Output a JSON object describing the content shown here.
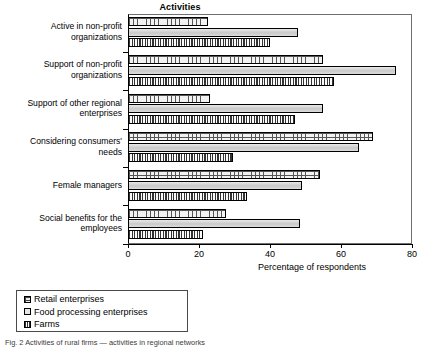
{
  "chart_data": {
    "type": "bar",
    "orientation": "horizontal",
    "title": "Activities",
    "xlabel": "Percentage of respondents",
    "ylabel": "",
    "xlim": [
      0,
      80
    ],
    "xticks": [
      0,
      20,
      40,
      60,
      80
    ],
    "grid": false,
    "legend_position": "below-left",
    "categories": [
      "Active in non-profit organizations",
      "Support of non-profit organizations",
      "Support of other regional enterprises",
      "Considering consumers' needs",
      "Female managers",
      "Social benefits for the employees"
    ],
    "category_lines": [
      [
        "Active in non-profit",
        "organizations"
      ],
      [
        "Support of non-profit",
        "organizations"
      ],
      [
        "Support of other regional",
        "enterprises"
      ],
      [
        "Considering consumers'",
        "needs"
      ],
      [
        "Female managers"
      ],
      [
        "Social benefits for the",
        "employees"
      ]
    ],
    "series": [
      {
        "name": "Retail enterprises",
        "values": [
          22.5,
          55,
          23,
          69,
          54,
          27.5
        ]
      },
      {
        "name": "Food processing enterprises",
        "values": [
          48,
          75.5,
          55,
          65,
          49,
          48.5
        ]
      },
      {
        "name": "Farms",
        "values": [
          40,
          58,
          47,
          29.5,
          33.5,
          21
        ]
      }
    ]
  },
  "legend": {
    "items": [
      {
        "label": "Retail enterprises"
      },
      {
        "label": "Food processing enterprises"
      },
      {
        "label": "Farms"
      }
    ]
  },
  "axis": {
    "tick_labels": [
      "0",
      "20",
      "40",
      "60",
      "80"
    ],
    "x_title": "Percentage of respondents"
  },
  "caption": {
    "text": "Fig. 2  Activities of rural firms — activities in regional networks"
  }
}
